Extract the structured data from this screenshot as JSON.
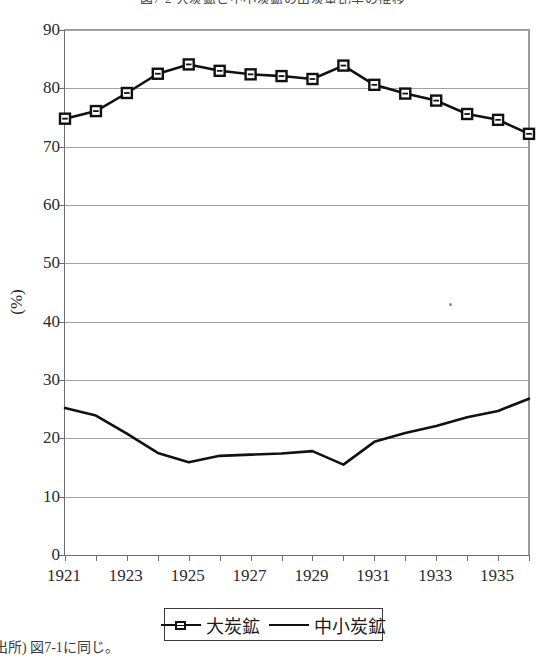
{
  "chart_data": {
    "type": "line",
    "title": "図7-2 大炭鉱と中小炭鉱の出炭量比率の推移",
    "xlabel": "",
    "ylabel": "(%)",
    "ylim": [
      0,
      90
    ],
    "ytick_step": 10,
    "xlim": [
      1921,
      1936
    ],
    "grid": true,
    "legend_position": "bottom",
    "x": [
      1921,
      1922,
      1923,
      1924,
      1925,
      1926,
      1927,
      1928,
      1929,
      1930,
      1931,
      1932,
      1933,
      1934,
      1935,
      1936
    ],
    "xtick_labels": [
      "1921",
      "1923",
      "1925",
      "1927",
      "1929",
      "1931",
      "1933",
      "1935"
    ],
    "xtick_values": [
      1921,
      1923,
      1925,
      1927,
      1929,
      1931,
      1933,
      1935
    ],
    "ytick_labels": [
      "0",
      "10",
      "20",
      "30",
      "40",
      "50",
      "60",
      "70",
      "80",
      "90"
    ],
    "ytick_values": [
      0,
      10,
      20,
      30,
      40,
      50,
      60,
      70,
      80,
      90
    ],
    "series": [
      {
        "name": "大炭鉱",
        "marker": "square",
        "color": "#111111",
        "values": [
          74.8,
          76.1,
          79.2,
          82.5,
          84.1,
          83.0,
          82.4,
          82.1,
          81.6,
          83.9,
          80.6,
          79.1,
          77.9,
          75.6,
          74.6,
          72.2
        ]
      },
      {
        "name": "中小炭鉱",
        "marker": "none",
        "color": "#111111",
        "values": [
          25.2,
          23.9,
          20.8,
          17.5,
          15.9,
          17.0,
          17.2,
          17.4,
          17.8,
          15.5,
          19.4,
          20.9,
          22.1,
          23.6,
          24.7,
          26.8
        ]
      }
    ]
  },
  "source_note": "出所) 図7-1に同じ。"
}
